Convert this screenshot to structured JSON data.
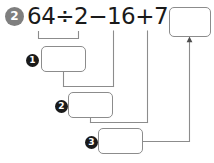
{
  "page": {
    "background_color": "#ffffff",
    "width": 214,
    "height": 163
  },
  "problem": {
    "number_label": "2",
    "badge_color": "#7f7f7f",
    "badge_text_color": "#ffffff"
  },
  "equation": {
    "full_text": "64÷2−16+7=",
    "tokens": [
      {
        "text": "64",
        "kind": "number"
      },
      {
        "text": "÷",
        "kind": "operator"
      },
      {
        "text": "2",
        "kind": "number"
      },
      {
        "text": "−",
        "kind": "operator"
      },
      {
        "text": "16",
        "kind": "number"
      },
      {
        "text": "+",
        "kind": "operator"
      },
      {
        "text": "7",
        "kind": "number"
      },
      {
        "text": "=",
        "kind": "operator"
      }
    ],
    "text_color": "#1a1a1a"
  },
  "steps": [
    {
      "marker_label": "1",
      "operation_shown": "64÷2",
      "value": "",
      "placeholder": ""
    },
    {
      "marker_label": "2",
      "operation_shown": "step1 − 16",
      "value": "",
      "placeholder": ""
    },
    {
      "marker_label": "3",
      "operation_shown": "step2 + 7",
      "value": "",
      "placeholder": ""
    }
  ],
  "answer": {
    "value": "",
    "placeholder": ""
  },
  "style": {
    "line_color": "#8c8c8c",
    "box_border_color": "#8c8c8c",
    "marker_color": "#1a1a1a",
    "marker_text_color": "#ffffff"
  }
}
